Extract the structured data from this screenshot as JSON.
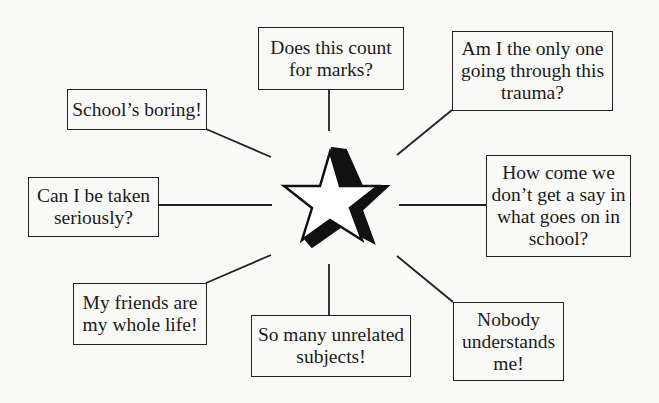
{
  "diagram": {
    "center": {
      "icon": "star-icon",
      "fill": "#ffffff",
      "stroke": "#111111",
      "shadow": "#111111"
    },
    "line_color": "#222222",
    "nodes": [
      {
        "id": "marks",
        "text": "Does this count for marks?"
      },
      {
        "id": "trauma",
        "text": "Am I the only one going through this trauma?"
      },
      {
        "id": "say",
        "text": "How come we don’t get a say in what goes on in school?"
      },
      {
        "id": "nobody",
        "text": "Nobody understands me!"
      },
      {
        "id": "subjects",
        "text": "So many unrelated subjects!"
      },
      {
        "id": "friends",
        "text": "My friends are my whole life!"
      },
      {
        "id": "serious",
        "text": "Can I be taken seriously?"
      },
      {
        "id": "boring",
        "text": "School’s boring!"
      }
    ]
  }
}
